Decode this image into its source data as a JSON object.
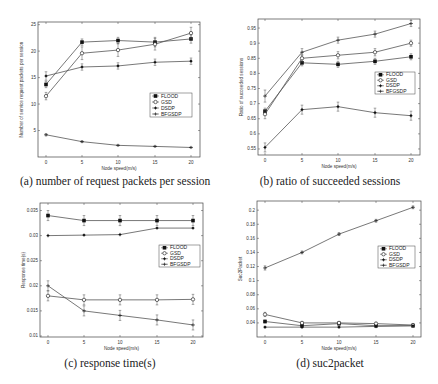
{
  "figure": {
    "captions": {
      "a": "(a) number of request packets per session",
      "b": "(b) ratio of succeeded sessions",
      "c": "(c) response time(s)",
      "d": "(d) suc2packet"
    }
  },
  "chart_data": [
    {
      "id": "a",
      "type": "line",
      "title": "(a) number of request packets per session",
      "xlabel": "Node speed(m/s)",
      "ylabel": "Number of service request packets per session",
      "x": [
        0,
        5,
        10,
        15,
        20
      ],
      "xticks": [
        "0",
        "5",
        "10",
        "15",
        "20"
      ],
      "yticks": [
        "5",
        "10",
        "15",
        "20",
        "25"
      ],
      "ylim": [
        0,
        25.5
      ],
      "grid": false,
      "legend_position": "center right",
      "series": [
        {
          "name": "FLOOD",
          "marker": "filled-square",
          "values": [
            13.7,
            21.7,
            22.0,
            21.7,
            22.3
          ],
          "err": [
            0.6,
            0.6,
            0.6,
            0.9,
            0.8
          ]
        },
        {
          "name": "GSD",
          "marker": "open-circle",
          "values": [
            11.5,
            19.6,
            20.2,
            21.3,
            23.4
          ],
          "err": [
            0.7,
            1.2,
            1.2,
            1.1,
            1.1
          ]
        },
        {
          "name": "DSDP",
          "marker": "star",
          "values": [
            15.3,
            17.0,
            17.2,
            17.9,
            18.1
          ],
          "err": [
            0.8,
            0.6,
            0.6,
            0.6,
            0.6
          ]
        },
        {
          "name": "BFGSDP",
          "marker": "plus",
          "values": [
            4.2,
            2.9,
            2.2,
            2.0,
            1.8
          ],
          "err": [
            0.2,
            0.15,
            0.1,
            0.1,
            0.1
          ]
        }
      ],
      "frame": {
        "left": 38,
        "top": 22,
        "right": 200,
        "bottom": 157
      },
      "xpix": [
        46,
        82,
        118,
        155,
        191
      ],
      "legend": {
        "x": 150,
        "y": 93,
        "w": 42,
        "h": 24
      }
    },
    {
      "id": "b",
      "type": "line",
      "title": "(b) ratio of succeeded sessions",
      "xlabel": "Node speed(m/s)",
      "ylabel": "Ratio of succeeded sessions",
      "x": [
        0,
        5,
        10,
        15,
        20
      ],
      "xticks": [
        "0",
        "5",
        "10",
        "15",
        "20"
      ],
      "yticks": [
        "0.55",
        "0.6",
        "0.65",
        "0.7",
        "0.75",
        "0.8",
        "0.85",
        "0.9",
        "0.95"
      ],
      "ylim": [
        0.53,
        0.98
      ],
      "grid": false,
      "legend_position": "center right",
      "series": [
        {
          "name": "FLOOD",
          "marker": "filled-square",
          "values": [
            0.675,
            0.835,
            0.83,
            0.84,
            0.855
          ],
          "err": [
            0.01,
            0.01,
            0.01,
            0.01,
            0.01
          ]
        },
        {
          "name": "GSD",
          "marker": "open-circle",
          "values": [
            0.665,
            0.85,
            0.86,
            0.87,
            0.9
          ],
          "err": [
            0.015,
            0.012,
            0.012,
            0.012,
            0.01
          ]
        },
        {
          "name": "DSDP",
          "marker": "star",
          "values": [
            0.555,
            0.68,
            0.69,
            0.67,
            0.66
          ],
          "err": [
            0.015,
            0.015,
            0.015,
            0.015,
            0.015
          ]
        },
        {
          "name": "BFGSDP",
          "marker": "plus",
          "values": [
            0.725,
            0.87,
            0.91,
            0.93,
            0.965
          ],
          "err": [
            0.02,
            0.012,
            0.01,
            0.01,
            0.01
          ]
        }
      ],
      "frame": {
        "left": 258,
        "top": 19,
        "right": 420,
        "bottom": 155
      },
      "xpix": [
        265,
        302,
        338,
        375,
        411
      ],
      "legend": {
        "x": 375,
        "y": 72,
        "w": 40,
        "h": 22
      }
    },
    {
      "id": "c",
      "type": "line",
      "title": "(c) response time(s)",
      "xlabel": "Node speed(m/s)",
      "ylabel": "Response time(s)",
      "x": [
        0,
        5,
        10,
        15,
        20
      ],
      "xticks": [
        "0",
        "5",
        "10",
        "15",
        "20"
      ],
      "yticks": [
        "0.01",
        "0.015",
        "0.02",
        "0.025",
        "0.03",
        "0.035"
      ],
      "ylim": [
        0.0098,
        0.0365
      ],
      "grid": false,
      "legend_position": "center right",
      "series": [
        {
          "name": "FLOOD",
          "marker": "filled-square",
          "values": [
            0.034,
            0.033,
            0.033,
            0.033,
            0.033
          ],
          "err": [
            0.001,
            0.001,
            0.001,
            0.001,
            0.001
          ]
        },
        {
          "name": "GSD",
          "marker": "open-circle",
          "values": [
            0.018,
            0.0172,
            0.0172,
            0.0172,
            0.0173
          ],
          "err": [
            0.001,
            0.001,
            0.001,
            0.001,
            0.001
          ]
        },
        {
          "name": "DSDP",
          "marker": "star",
          "values": [
            0.03,
            0.0301,
            0.0302,
            0.0315,
            0.0315
          ],
          "err": [
            0,
            0,
            0,
            0,
            0
          ]
        },
        {
          "name": "BFGSDP",
          "marker": "plus",
          "values": [
            0.02,
            0.015,
            0.0141,
            0.0132,
            0.0122
          ],
          "err": [
            0.001,
            0.001,
            0.001,
            0.001,
            0.001
          ]
        }
      ],
      "frame": {
        "left": 40,
        "top": 203,
        "right": 203,
        "bottom": 337
      },
      "xpix": [
        48,
        84,
        120,
        157,
        193
      ],
      "legend": {
        "x": 159,
        "y": 245,
        "w": 41,
        "h": 22
      }
    },
    {
      "id": "d",
      "type": "line",
      "title": "(d) suc2packet",
      "xlabel": "Node speed(m/s)",
      "ylabel": "Suc2Packet",
      "x": [
        0,
        5,
        10,
        15,
        20
      ],
      "xticks": [
        "0",
        "5",
        "10",
        "15",
        "20"
      ],
      "yticks": [
        "0.04",
        "0.06",
        "0.08",
        "0.1",
        "0.12",
        "0.14",
        "0.16",
        "0.18",
        "0.2"
      ],
      "ylim": [
        0.02,
        0.213
      ],
      "grid": false,
      "legend_position": "center right",
      "series": [
        {
          "name": "FLOOD",
          "marker": "filled-square",
          "values": [
            0.042,
            0.036,
            0.039,
            0.036,
            0.036
          ],
          "err": [
            0.002,
            0.002,
            0.002,
            0.002,
            0.002
          ]
        },
        {
          "name": "GSD",
          "marker": "open-circle",
          "values": [
            0.052,
            0.04,
            0.04,
            0.039,
            0.037
          ],
          "err": [
            0.003,
            0.002,
            0.002,
            0.002,
            0.002
          ]
        },
        {
          "name": "DSDP",
          "marker": "star",
          "values": [
            0.034,
            0.034,
            0.034,
            0.035,
            0.036
          ],
          "err": [
            0.001,
            0.001,
            0.001,
            0.001,
            0.001
          ]
        },
        {
          "name": "BFGSDP",
          "marker": "plus",
          "values": [
            0.118,
            0.14,
            0.166,
            0.185,
            0.204
          ],
          "err": [
            0.003,
            0.002,
            0.002,
            0.002,
            0.002
          ]
        }
      ],
      "frame": {
        "left": 257,
        "top": 201,
        "right": 421,
        "bottom": 337
      },
      "xpix": [
        265,
        302,
        339,
        376,
        413
      ],
      "legend": {
        "x": 378,
        "y": 246,
        "w": 37,
        "h": 22
      }
    }
  ],
  "style": {
    "line_color": "#555555",
    "frame_color": "#444444",
    "marker_color": "#111111"
  },
  "captions_pos": {
    "a": {
      "x": 110,
      "y": 173
    },
    "b": {
      "x": 330,
      "y": 173
    },
    "c": {
      "x": 110,
      "y": 355
    },
    "d": {
      "x": 330,
      "y": 355
    }
  }
}
